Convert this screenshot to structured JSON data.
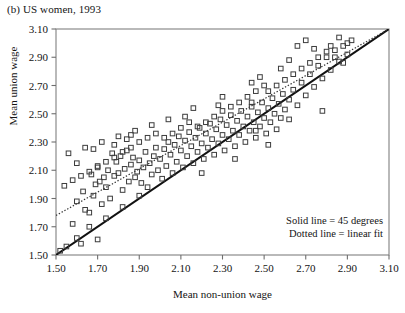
{
  "figure": {
    "panel_label": "(b) US women, 1993",
    "xlabel": "Mean non-union wage",
    "ylabel": "Mean union wage",
    "legend": {
      "solid": "Solid line = 45 degrees",
      "dotted": "Dotted line = linear fit"
    }
  },
  "chart_data": {
    "type": "scatter",
    "title": "(b) US women, 1993",
    "xlabel": "Mean non-union wage",
    "ylabel": "Mean union wage",
    "xlim": [
      1.5,
      3.1
    ],
    "ylim": [
      1.5,
      3.1
    ],
    "xticks": [
      "1.50",
      "1.70",
      "1.90",
      "2.10",
      "2.30",
      "2.50",
      "2.70",
      "2.90",
      "3.10"
    ],
    "yticks": [
      "1.50",
      "1.70",
      "1.90",
      "2.10",
      "2.30",
      "2.50",
      "2.70",
      "2.90",
      "3.10"
    ],
    "xtick_values": [
      1.5,
      1.7,
      1.9,
      2.1,
      2.3,
      2.5,
      2.7,
      2.9,
      3.1
    ],
    "ytick_values": [
      1.5,
      1.7,
      1.9,
      2.1,
      2.3,
      2.5,
      2.7,
      2.9,
      3.1
    ],
    "grid": false,
    "marker": "open-square",
    "marker_color": "#3c3c3c",
    "legend_position": "lower-right",
    "annotations": [
      "Solid line = 45 degrees",
      "Dotted line = linear fit"
    ],
    "lines": [
      {
        "name": "45 degrees",
        "style": "solid",
        "color": "#111111",
        "x": [
          1.5,
          3.1
        ],
        "y": [
          1.5,
          3.1
        ]
      },
      {
        "name": "linear fit",
        "style": "dotted",
        "color": "#333333",
        "x": [
          1.5,
          3.1
        ],
        "y": [
          1.78,
          3.1
        ]
      }
    ],
    "series": [
      {
        "name": "US women 1993",
        "points": [
          [
            1.52,
            1.53
          ],
          [
            1.55,
            1.56
          ],
          [
            1.6,
            1.62
          ],
          [
            1.58,
            1.72
          ],
          [
            1.62,
            1.58
          ],
          [
            1.64,
            1.82
          ],
          [
            1.66,
            1.7
          ],
          [
            1.6,
            1.88
          ],
          [
            1.68,
            1.92
          ],
          [
            1.63,
            1.95
          ],
          [
            1.7,
            1.61
          ],
          [
            1.72,
            1.86
          ],
          [
            1.69,
            2.0
          ],
          [
            1.71,
            2.02
          ],
          [
            1.73,
            2.05
          ],
          [
            1.67,
            2.07
          ],
          [
            1.74,
            1.98
          ],
          [
            1.75,
            2.1
          ],
          [
            1.76,
            1.9
          ],
          [
            1.7,
            2.12
          ],
          [
            1.78,
            2.06
          ],
          [
            1.79,
            2.16
          ],
          [
            1.77,
            2.22
          ],
          [
            1.8,
            2.08
          ],
          [
            1.81,
            2.2
          ],
          [
            1.82,
            1.96
          ],
          [
            1.83,
            2.11
          ],
          [
            1.84,
            2.24
          ],
          [
            1.85,
            2.02
          ],
          [
            1.86,
            2.14
          ],
          [
            1.87,
            2.19
          ],
          [
            1.88,
            2.05
          ],
          [
            1.78,
            2.28
          ],
          [
            1.89,
            2.09
          ],
          [
            1.9,
            2.17
          ],
          [
            1.91,
            2.01
          ],
          [
            1.92,
            2.12
          ],
          [
            1.93,
            2.23
          ],
          [
            1.94,
            1.98
          ],
          [
            1.95,
            2.15
          ],
          [
            1.96,
            2.07
          ],
          [
            1.97,
            2.2
          ],
          [
            1.98,
            2.26
          ],
          [
            1.84,
            2.32
          ],
          [
            1.86,
            2.35
          ],
          [
            1.99,
            2.1
          ],
          [
            2.0,
            2.18
          ],
          [
            2.01,
            2.04
          ],
          [
            2.02,
            2.25
          ],
          [
            2.03,
            2.13
          ],
          [
            2.04,
            2.3
          ],
          [
            2.05,
            2.21
          ],
          [
            2.06,
            2.08
          ],
          [
            2.07,
            2.28
          ],
          [
            2.08,
            2.16
          ],
          [
            2.09,
            2.34
          ],
          [
            2.1,
            2.24
          ],
          [
            2.11,
            2.12
          ],
          [
            2.12,
            2.31
          ],
          [
            2.13,
            2.2
          ],
          [
            2.14,
            2.37
          ],
          [
            2.15,
            2.27
          ],
          [
            2.16,
            2.15
          ],
          [
            2.17,
            2.33
          ],
          [
            2.18,
            2.23
          ],
          [
            2.19,
            2.4
          ],
          [
            2.2,
            2.29
          ],
          [
            2.21,
            2.18
          ],
          [
            2.22,
            2.36
          ],
          [
            2.23,
            2.26
          ],
          [
            2.24,
            2.43
          ],
          [
            2.25,
            2.32
          ],
          [
            2.26,
            2.21
          ],
          [
            2.27,
            2.39
          ],
          [
            2.28,
            2.29
          ],
          [
            2.29,
            2.46
          ],
          [
            2.3,
            2.35
          ],
          [
            2.31,
            2.24
          ],
          [
            2.32,
            2.42
          ],
          [
            2.33,
            2.32
          ],
          [
            2.34,
            2.49
          ],
          [
            2.35,
            2.38
          ],
          [
            2.36,
            2.27
          ],
          [
            2.37,
            2.45
          ],
          [
            2.38,
            2.35
          ],
          [
            2.39,
            2.52
          ],
          [
            2.4,
            2.41
          ],
          [
            2.41,
            2.3
          ],
          [
            2.42,
            2.48
          ],
          [
            2.43,
            2.38
          ],
          [
            2.44,
            2.55
          ],
          [
            2.45,
            2.44
          ],
          [
            2.46,
            2.33
          ],
          [
            2.47,
            2.51
          ],
          [
            2.48,
            2.41
          ],
          [
            2.49,
            2.58
          ],
          [
            2.5,
            2.47
          ],
          [
            2.51,
            2.36
          ],
          [
            2.52,
            2.54
          ],
          [
            2.53,
            2.44
          ],
          [
            2.54,
            2.61
          ],
          [
            2.55,
            2.5
          ],
          [
            2.56,
            2.39
          ],
          [
            2.57,
            2.57
          ],
          [
            2.58,
            2.47
          ],
          [
            2.59,
            2.64
          ],
          [
            2.6,
            2.53
          ],
          [
            2.62,
            2.6
          ],
          [
            2.64,
            2.67
          ],
          [
            2.66,
            2.56
          ],
          [
            2.68,
            2.72
          ],
          [
            2.7,
            2.63
          ],
          [
            2.72,
            2.78
          ],
          [
            2.74,
            2.69
          ],
          [
            2.76,
            2.84
          ],
          [
            2.78,
            2.75
          ],
          [
            2.8,
            2.9
          ],
          [
            2.82,
            2.81
          ],
          [
            2.84,
            2.95
          ],
          [
            2.86,
            2.87
          ],
          [
            2.88,
            2.98
          ],
          [
            2.9,
            2.92
          ],
          [
            2.92,
            3.02
          ],
          [
            2.58,
            2.82
          ],
          [
            2.62,
            2.88
          ],
          [
            2.5,
            2.7
          ],
          [
            2.46,
            2.66
          ],
          [
            2.42,
            2.62
          ],
          [
            2.38,
            2.58
          ],
          [
            2.34,
            2.55
          ],
          [
            2.3,
            2.52
          ],
          [
            2.26,
            2.48
          ],
          [
            2.22,
            2.44
          ],
          [
            2.18,
            2.41
          ],
          [
            2.14,
            2.44
          ],
          [
            2.1,
            2.4
          ],
          [
            2.06,
            2.36
          ],
          [
            2.02,
            2.33
          ],
          [
            1.98,
            2.36
          ],
          [
            1.94,
            2.33
          ],
          [
            1.9,
            2.3
          ],
          [
            1.86,
            2.26
          ],
          [
            1.82,
            2.23
          ],
          [
            1.78,
            2.19
          ],
          [
            1.74,
            2.16
          ],
          [
            1.7,
            2.13
          ],
          [
            1.66,
            2.09
          ],
          [
            1.62,
            2.06
          ],
          [
            1.58,
            2.03
          ],
          [
            1.54,
            1.99
          ],
          [
            2.44,
            2.72
          ],
          [
            2.48,
            2.76
          ],
          [
            2.52,
            2.66
          ],
          [
            2.56,
            2.7
          ],
          [
            2.6,
            2.74
          ],
          [
            2.64,
            2.78
          ],
          [
            2.68,
            2.82
          ],
          [
            2.72,
            2.86
          ],
          [
            2.76,
            2.9
          ],
          [
            2.8,
            2.94
          ],
          [
            2.84,
            2.9
          ],
          [
            2.88,
            2.86
          ],
          [
            2.66,
            2.98
          ],
          [
            2.7,
            3.02
          ],
          [
            2.74,
            2.96
          ],
          [
            2.82,
            2.98
          ],
          [
            2.86,
            3.04
          ],
          [
            2.9,
            3.0
          ],
          [
            2.78,
            2.52
          ],
          [
            2.62,
            2.46
          ],
          [
            2.46,
            2.38
          ],
          [
            2.3,
            2.62
          ],
          [
            2.16,
            2.54
          ],
          [
            2.04,
            2.46
          ],
          [
            1.96,
            2.42
          ],
          [
            1.88,
            2.38
          ],
          [
            1.8,
            2.34
          ],
          [
            1.72,
            2.3
          ],
          [
            1.64,
            2.26
          ],
          [
            1.56,
            2.22
          ],
          [
            1.66,
            1.8
          ],
          [
            1.74,
            1.76
          ],
          [
            1.82,
            1.84
          ],
          [
            1.9,
            1.92
          ],
          [
            1.68,
            2.25
          ],
          [
            1.6,
            2.15
          ],
          [
            2.2,
            2.08
          ],
          [
            2.36,
            2.18
          ],
          [
            2.52,
            2.28
          ],
          [
            2.44,
            2.58
          ],
          [
            2.28,
            2.56
          ],
          [
            2.12,
            2.48
          ]
        ]
      }
    ]
  }
}
